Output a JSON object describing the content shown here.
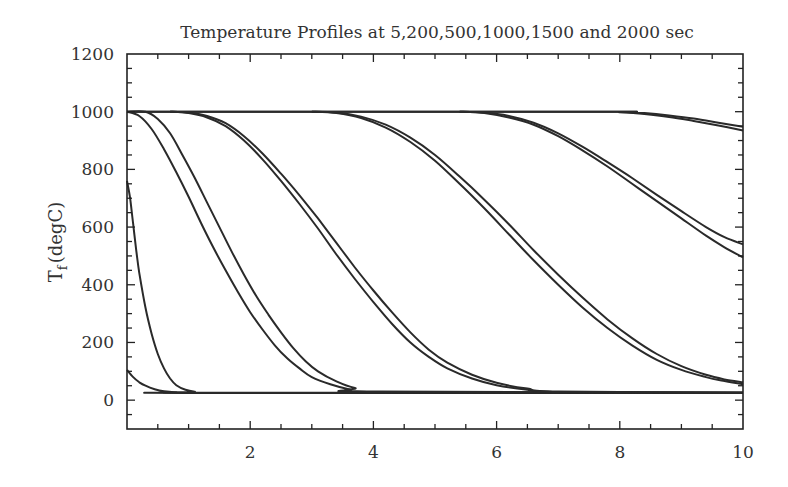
{
  "chart_data": {
    "type": "line",
    "title": "Temperature Profiles at 5,200,500,1000,1500 and 2000 sec",
    "xlabel": "",
    "ylabel": "T_f (degC)",
    "ylabel_main": "T",
    "ylabel_sub": "f",
    "ylabel_rest": "(degC)",
    "xlim": [
      0,
      10
    ],
    "ylim": [
      -100,
      1200
    ],
    "x_ticks": [
      2,
      4,
      6,
      8,
      10
    ],
    "x_tick_labels": [
      "2",
      "4",
      "6",
      "8",
      "10"
    ],
    "x_minor_step": 0.5,
    "y_ticks": [
      0,
      200,
      400,
      600,
      800,
      1000,
      1200
    ],
    "y_tick_labels": [
      "0",
      "200",
      "400",
      "600",
      "800",
      "1000",
      "1200"
    ],
    "y_minor_step": 50,
    "grid": false,
    "legend": null,
    "line_color": "#2a2a2a",
    "series": [
      {
        "name": "t=5 s (a)",
        "x": [
          0,
          0.1,
          0.2,
          0.3,
          0.45,
          0.6,
          0.8,
          1.0,
          10
        ],
        "y": [
          105,
          80,
          62,
          50,
          38,
          31,
          27,
          25,
          25
        ]
      },
      {
        "name": "t=5 s (b)",
        "x": [
          0,
          0.05,
          0.1,
          0.15,
          0.2,
          0.3,
          0.4,
          0.5,
          0.6,
          0.7,
          0.8,
          0.95,
          1.1,
          1.3,
          10
        ],
        "y": [
          760,
          700,
          610,
          520,
          440,
          320,
          230,
          160,
          110,
          75,
          52,
          36,
          29,
          26,
          26
        ]
      },
      {
        "name": "t=200 s (a)",
        "x": [
          0,
          0.2,
          0.4,
          0.6,
          0.8,
          1.0,
          1.2,
          1.4,
          1.6,
          1.8,
          2.0,
          2.2,
          2.4,
          2.6,
          2.8,
          3.0,
          3.3,
          3.6,
          4.0,
          10
        ],
        "y": [
          1000,
          985,
          940,
          870,
          790,
          705,
          615,
          530,
          450,
          375,
          305,
          245,
          190,
          145,
          110,
          80,
          55,
          38,
          28,
          26
        ]
      },
      {
        "name": "t=200 s (b)",
        "x": [
          0,
          0.3,
          0.5,
          0.7,
          0.9,
          1.1,
          1.3,
          1.5,
          1.7,
          1.9,
          2.1,
          2.3,
          2.5,
          2.7,
          2.9,
          3.1,
          3.4,
          3.7,
          4.1,
          10
        ],
        "y": [
          1000,
          1000,
          975,
          925,
          850,
          770,
          685,
          600,
          515,
          435,
          360,
          295,
          235,
          180,
          135,
          100,
          65,
          42,
          30,
          26
        ]
      },
      {
        "name": "t=500 s (a)",
        "x": [
          0.7,
          1.0,
          1.3,
          1.6,
          1.9,
          2.2,
          2.5,
          2.8,
          3.1,
          3.4,
          3.7,
          4.0,
          4.3,
          4.6,
          4.9,
          5.2,
          5.6,
          6.0,
          6.5,
          7.0,
          10
        ],
        "y": [
          1000,
          995,
          980,
          950,
          900,
          835,
          760,
          680,
          595,
          505,
          420,
          340,
          265,
          200,
          150,
          110,
          75,
          52,
          36,
          28,
          26
        ]
      },
      {
        "name": "t=500 s (b)",
        "x": [
          0.7,
          1.0,
          1.3,
          1.6,
          1.9,
          2.2,
          2.5,
          2.8,
          3.1,
          3.4,
          3.7,
          4.0,
          4.3,
          4.6,
          4.9,
          5.2,
          5.6,
          6.0,
          6.5,
          7.0,
          10
        ],
        "y": [
          1000,
          997,
          985,
          960,
          915,
          855,
          785,
          710,
          630,
          545,
          460,
          380,
          305,
          235,
          175,
          130,
          88,
          60,
          40,
          30,
          26
        ]
      },
      {
        "name": "t=1000 s (a)",
        "x": [
          3.0,
          3.4,
          3.8,
          4.2,
          4.6,
          5.0,
          5.4,
          5.8,
          6.2,
          6.6,
          7.0,
          7.4,
          7.8,
          8.2,
          8.6,
          9.0,
          9.4,
          9.7,
          10.0
        ],
        "y": [
          1000,
          995,
          978,
          945,
          895,
          830,
          750,
          665,
          575,
          485,
          400,
          320,
          250,
          190,
          140,
          105,
          80,
          66,
          55
        ]
      },
      {
        "name": "t=1000 s (b)",
        "x": [
          3.0,
          3.4,
          3.8,
          4.2,
          4.6,
          5.0,
          5.4,
          5.8,
          6.2,
          6.6,
          7.0,
          7.4,
          7.8,
          8.2,
          8.6,
          9.0,
          9.4,
          9.7,
          10.0
        ],
        "y": [
          1000,
          997,
          983,
          955,
          910,
          850,
          775,
          695,
          610,
          520,
          435,
          355,
          280,
          215,
          160,
          118,
          88,
          72,
          62
        ]
      },
      {
        "name": "t=1500 s (a)",
        "x": [
          5.4,
          5.8,
          6.2,
          6.6,
          7.0,
          7.4,
          7.8,
          8.2,
          8.6,
          9.0,
          9.4,
          9.7,
          10.0
        ],
        "y": [
          1000,
          995,
          980,
          955,
          915,
          865,
          810,
          750,
          690,
          630,
          570,
          530,
          495
        ]
      },
      {
        "name": "t=1500 s (b)",
        "x": [
          5.4,
          5.8,
          6.2,
          6.6,
          7.0,
          7.4,
          7.8,
          8.2,
          8.6,
          9.0,
          9.4,
          9.7,
          10.0
        ],
        "y": [
          1000,
          997,
          985,
          962,
          925,
          878,
          825,
          770,
          712,
          655,
          600,
          565,
          540
        ]
      },
      {
        "name": "t=2000 s (a)",
        "x": [
          0,
          7.6,
          8.0,
          8.4,
          8.8,
          9.2,
          9.6,
          10.0
        ],
        "y": [
          1000,
          1000,
          998,
          992,
          982,
          968,
          952,
          935
        ]
      },
      {
        "name": "t=2000 s (b)",
        "x": [
          0,
          7.6,
          8.0,
          8.4,
          8.8,
          9.2,
          9.6,
          10.0
        ],
        "y": [
          1000,
          1000,
          999,
          995,
          987,
          976,
          962,
          948
        ]
      }
    ]
  }
}
